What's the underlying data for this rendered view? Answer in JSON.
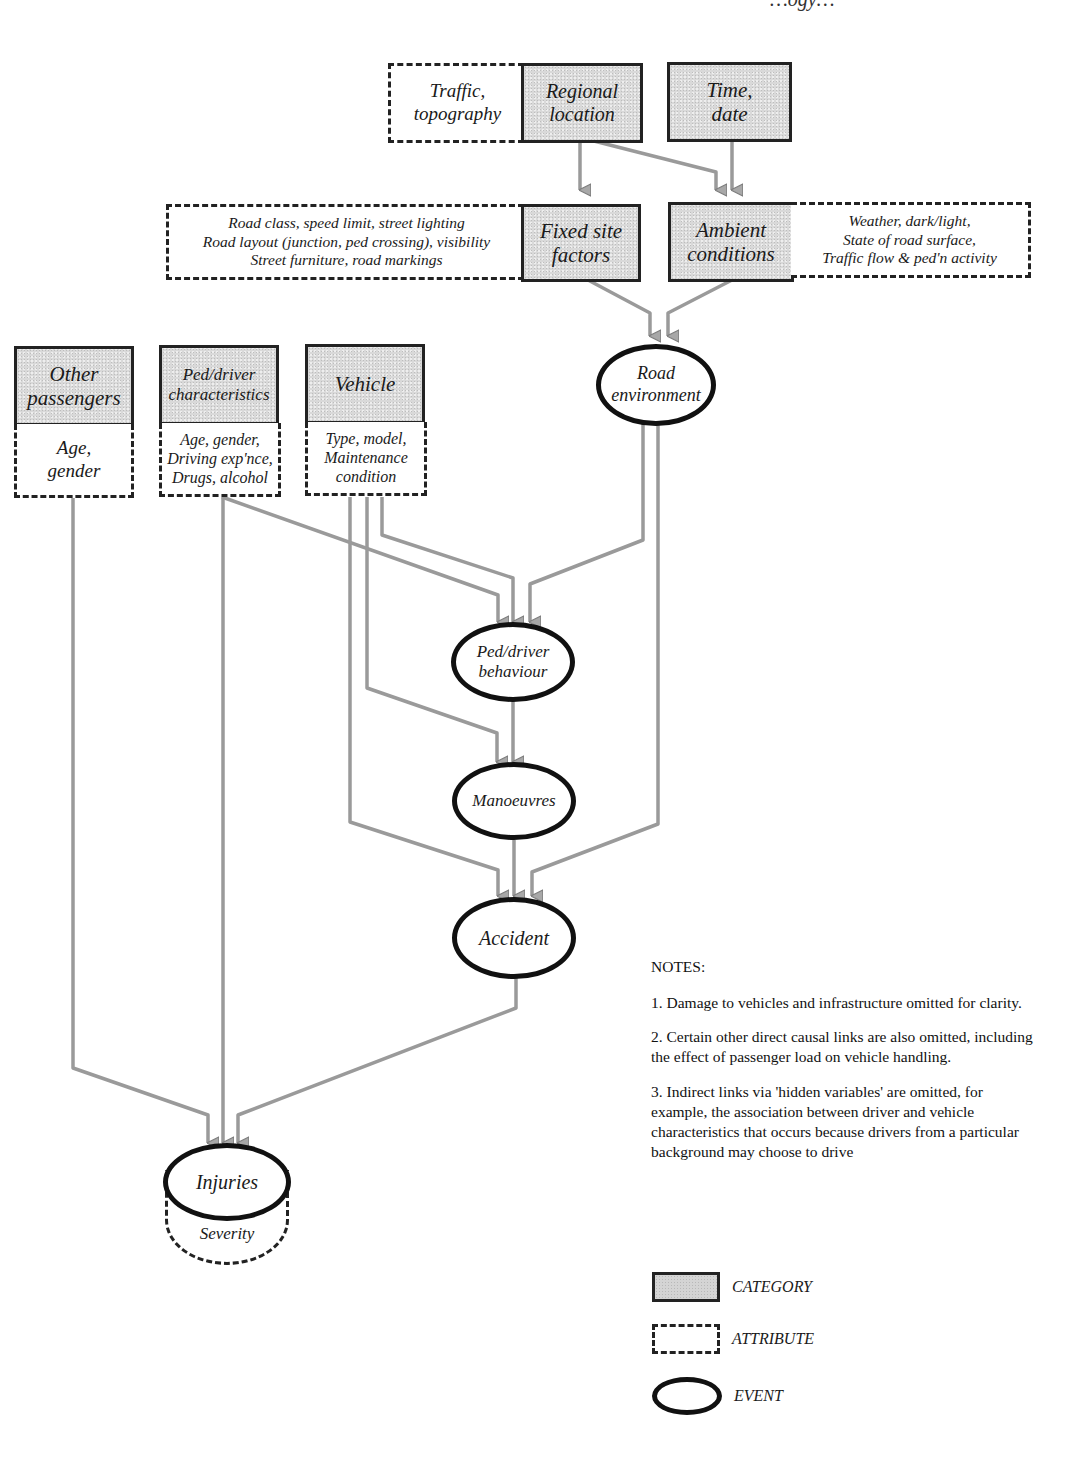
{
  "header": {
    "fragment": "…ogy…"
  },
  "colors": {
    "category_fill": "#d9d9d9",
    "border": "#222222",
    "arrow": "#9a9a9a",
    "background": "#ffffff"
  },
  "nodes": {
    "traffic_topography": {
      "type": "attribute",
      "label": "Traffic,\ntopography"
    },
    "regional_location": {
      "type": "category",
      "label": "Regional\nlocation"
    },
    "time_date": {
      "type": "category",
      "label": "Time,\ndate"
    },
    "fixed_site_factors": {
      "type": "category",
      "label": "Fixed site\nfactors"
    },
    "fixed_site_attr": {
      "type": "attribute",
      "label": "Road class, speed limit, street lighting\nRoad layout (junction, ped crossing), visibility\nStreet furniture, road markings"
    },
    "ambient_conditions": {
      "type": "category",
      "label": "Ambient\nconditions"
    },
    "ambient_attr": {
      "type": "attribute",
      "label": "Weather, dark/light,\nState of road surface,\nTraffic flow & ped'n activity"
    },
    "road_environment": {
      "type": "event",
      "label": "Road\nenvironment"
    },
    "other_passengers": {
      "type": "category",
      "label": "Other\npassengers"
    },
    "other_passengers_attr": {
      "type": "attribute",
      "label": "Age,\ngender"
    },
    "ped_driver_characteristics": {
      "type": "category",
      "label": "Ped/driver\ncharacteristics"
    },
    "ped_driver_attr": {
      "type": "attribute",
      "label": "Age, gender,\nDriving exp'nce,\nDrugs, alcohol"
    },
    "vehicle": {
      "type": "category",
      "label": "Vehicle"
    },
    "vehicle_attr": {
      "type": "attribute",
      "label": "Type, model,\nMaintenance\ncondition"
    },
    "ped_driver_behaviour": {
      "type": "event",
      "label": "Ped/driver\nbehaviour"
    },
    "manoeuvres": {
      "type": "event",
      "label": "Manoeuvres"
    },
    "accident": {
      "type": "event",
      "label": "Accident"
    },
    "injuries": {
      "type": "event",
      "label": "Injuries"
    },
    "injuries_attr": {
      "type": "attribute",
      "label": "Severity"
    }
  },
  "edges": [
    [
      "Regional location",
      "Fixed site factors"
    ],
    [
      "Regional location",
      "Ambient conditions"
    ],
    [
      "Time, date",
      "Ambient conditions"
    ],
    [
      "Fixed site factors",
      "Road environment"
    ],
    [
      "Ambient conditions",
      "Road environment"
    ],
    [
      "Ped/driver characteristics",
      "Ped/driver behaviour"
    ],
    [
      "Vehicle",
      "Ped/driver behaviour"
    ],
    [
      "Road environment",
      "Ped/driver behaviour"
    ],
    [
      "Vehicle",
      "Manoeuvres"
    ],
    [
      "Ped/driver behaviour",
      "Manoeuvres"
    ],
    [
      "Vehicle",
      "Accident"
    ],
    [
      "Manoeuvres",
      "Accident"
    ],
    [
      "Road environment",
      "Accident"
    ],
    [
      "Other passengers",
      "Injuries"
    ],
    [
      "Ped/driver characteristics",
      "Injuries"
    ],
    [
      "Accident",
      "Injuries"
    ]
  ],
  "notes": {
    "title": "NOTES:",
    "items": [
      "1. Damage to vehicles and infrastructure omitted for clarity.",
      "2. Certain other direct causal links are also omitted, including the effect of passenger load on vehicle handling.",
      "3. Indirect links via 'hidden variables' are omitted, for example, the association between driver and vehicle characteristics that occurs because drivers from a particular background may choose to drive"
    ]
  },
  "legend": [
    {
      "shape": "category",
      "label": "CATEGORY"
    },
    {
      "shape": "attribute",
      "label": "ATTRIBUTE"
    },
    {
      "shape": "event",
      "label": "EVENT"
    }
  ]
}
